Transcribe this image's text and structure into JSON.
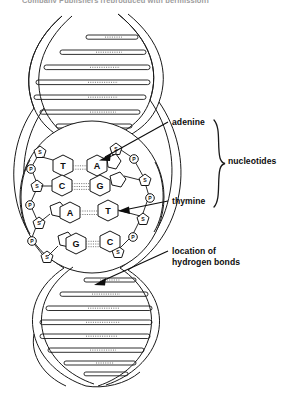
{
  "figure": {
    "clipped_top_caption": "Company  Publishers   (reproduced   with   permission)"
  },
  "labels": {
    "adenine": "adenine",
    "thymine": "thymine",
    "nucleotides": "nucleotides",
    "hydrogen_bonds_line1": "location of",
    "hydrogen_bonds_line2": "hydrogen bonds"
  },
  "base_pairs": [
    {
      "left": "T",
      "right": "A"
    },
    {
      "left": "C",
      "right": "G"
    },
    {
      "left": "A",
      "right": "T"
    },
    {
      "left": "G",
      "right": "C"
    }
  ],
  "backbone_units": {
    "sugar": "S",
    "phosphate": "P"
  },
  "colors": {
    "ink": "#111111",
    "paper": "#ffffff",
    "hydrogen_bond": "#6b6b6b"
  }
}
